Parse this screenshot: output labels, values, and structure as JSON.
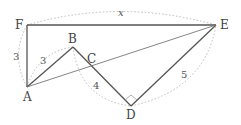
{
  "diagram": {
    "type": "geometry",
    "colors": {
      "solid_line": "#555555",
      "thin_line": "#777777",
      "dotted_arc": "#bbbbbb",
      "label": "#444444"
    },
    "points": {
      "F": {
        "label": "F",
        "x": 27,
        "y": 25
      },
      "E": {
        "label": "E",
        "x": 216,
        "y": 25
      },
      "A": {
        "label": "A",
        "x": 27,
        "y": 87
      },
      "B": {
        "label": "B",
        "x": 73,
        "y": 47
      },
      "C": {
        "label": "C",
        "x": 90,
        "y": 66
      },
      "D": {
        "label": "D",
        "x": 131,
        "y": 106
      }
    },
    "segments": [
      {
        "from": "F",
        "to": "E",
        "style": "solid"
      },
      {
        "from": "F",
        "to": "A",
        "style": "solid"
      },
      {
        "from": "A",
        "to": "B",
        "style": "solid"
      },
      {
        "from": "B",
        "to": "D",
        "style": "solid"
      },
      {
        "from": "D",
        "to": "E",
        "style": "solid"
      },
      {
        "from": "A",
        "to": "E",
        "style": "thin"
      }
    ],
    "lengths": {
      "FE": "x",
      "FA": "3",
      "AB": "3",
      "BD": "4",
      "DE": "5"
    },
    "right_angles": [
      "D"
    ]
  }
}
